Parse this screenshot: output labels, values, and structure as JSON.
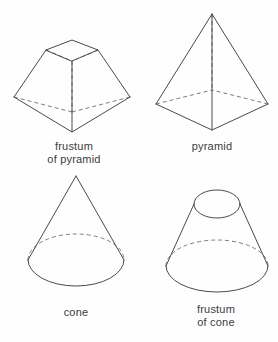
{
  "page": {
    "background_color": "#fefefe",
    "line_color": "#4a4a4a",
    "hidden_line_color": "#7d7d7d",
    "text_color": "#3c3c3c",
    "width": 278,
    "height": 342
  },
  "figures": [
    {
      "id": "frustum-of-pyramid",
      "caption": "frustum\nof pyramid",
      "caption_lines": [
        "frustum",
        "of pyramid"
      ],
      "shape_type": "frustum-of-pyramid",
      "visible_edges": "solid",
      "hidden_edges": "dashed"
    },
    {
      "id": "pyramid",
      "caption": "pyramid",
      "caption_lines": [
        "pyramid"
      ],
      "shape_type": "pyramid",
      "visible_edges": "solid",
      "hidden_edges": "dashed"
    },
    {
      "id": "cone",
      "caption": "cone",
      "caption_lines": [
        "cone"
      ],
      "shape_type": "cone",
      "visible_edges": "solid",
      "hidden_edges": "dashed"
    },
    {
      "id": "frustum-of-cone",
      "caption": "frustum\nof cone",
      "caption_lines": [
        "frustum",
        "of cone"
      ],
      "shape_type": "frustum-of-cone",
      "visible_edges": "solid",
      "hidden_edges": "dashed"
    }
  ]
}
